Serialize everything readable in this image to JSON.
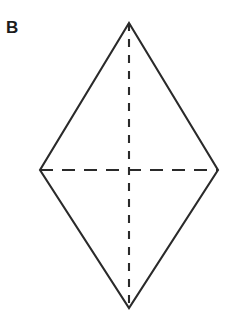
{
  "figure": {
    "label": "B",
    "shape_name": "rhombus",
    "background_color": "#ffffff",
    "stroke_color": "#2a2a2a",
    "canvas": {
      "width": 233,
      "height": 314
    },
    "vertices": {
      "top": {
        "x": 129,
        "y": 23
      },
      "right": {
        "x": 218,
        "y": 170
      },
      "bottom": {
        "x": 129,
        "y": 308
      },
      "left": {
        "x": 40,
        "y": 170
      }
    },
    "center": {
      "x": 129,
      "y": 170
    },
    "outline_points": "129,23 218,170 129,308 40,170",
    "diagonals": [
      {
        "name": "vertical-diagonal",
        "x1": 129,
        "y1": 23,
        "x2": 129,
        "y2": 308,
        "style": "dashed",
        "dash_pattern": "8 8"
      },
      {
        "name": "horizontal-diagonal",
        "x1": 40,
        "y1": 170,
        "x2": 218,
        "y2": 170,
        "style": "dashed",
        "dash_pattern": "13 9"
      }
    ],
    "stroke_width": 2.1
  }
}
